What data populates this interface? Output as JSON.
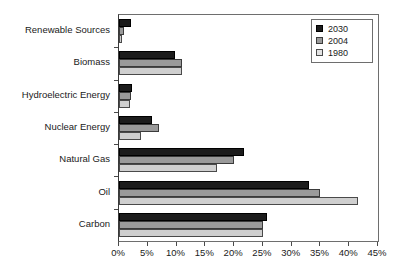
{
  "chart_data": {
    "type": "bar",
    "orientation": "horizontal",
    "title": "",
    "xlabel": "",
    "ylabel": "",
    "xlim": [
      0,
      45
    ],
    "xunit": "%",
    "grid": false,
    "legend_position": "top-right",
    "categories": [
      "Renewable Sources",
      "Biomass",
      "Hydroelectric Energy",
      "Nuclear Energy",
      "Natural Gas",
      "Oil",
      "Carbon"
    ],
    "xticklabels": [
      "0%",
      "5%",
      "10%",
      "15%",
      "20%",
      "25%",
      "30%",
      "35%",
      "40%",
      "45%"
    ],
    "xtickvalues": [
      0,
      5,
      10,
      15,
      20,
      25,
      30,
      35,
      40,
      45
    ],
    "series": [
      {
        "name": "2030",
        "color": "#1c1c1c",
        "values": [
          2.0,
          9.7,
          2.2,
          5.8,
          21.8,
          33.0,
          25.8
        ]
      },
      {
        "name": "2004",
        "color": "#9a9a9a",
        "values": [
          0.9,
          10.9,
          2.0,
          7.0,
          20.0,
          35.0,
          25.0
        ]
      },
      {
        "name": "1980",
        "color": "#cfcfcf",
        "values": [
          0.6,
          10.9,
          1.9,
          3.8,
          17.0,
          41.6,
          25.0
        ]
      }
    ]
  },
  "legend": {
    "entries": [
      {
        "label": "2030",
        "swatch": "legend-swatch-2030"
      },
      {
        "label": "2004",
        "swatch": "legend-swatch-2004"
      },
      {
        "label": "1980",
        "swatch": "legend-swatch-1980"
      }
    ]
  }
}
